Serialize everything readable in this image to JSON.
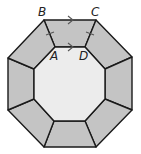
{
  "diagram": {
    "type": "octagonal-frame",
    "colors": {
      "trapezoid_fill": "#c4c4c4",
      "inner_fill": "#ececec",
      "stroke": "#1a1a1a",
      "marks": "#555555"
    },
    "labels": {
      "A": "A",
      "B": "B",
      "C": "C",
      "D": "D"
    },
    "marks": {
      "parallel_arrows": [
        "BC",
        "AD"
      ],
      "congruent_ticks": [
        "AB",
        "CD"
      ]
    }
  }
}
